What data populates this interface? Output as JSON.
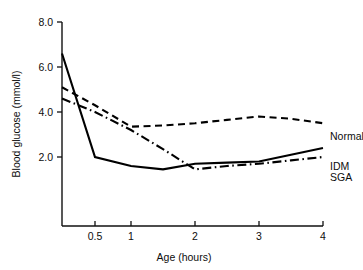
{
  "chart_data": {
    "type": "line",
    "title": "",
    "xlabel": "Age (hours)",
    "ylabel": "Blood glucose (mmol/l)",
    "xlim": [
      0.2,
      4
    ],
    "ylim": [
      1.0,
      8.0
    ],
    "x_ticks": [
      0.5,
      1,
      2,
      3,
      4
    ],
    "x_tick_labels": [
      "0.5",
      "1",
      "2",
      "3",
      "4"
    ],
    "y_ticks": [
      2.0,
      4.0,
      6.0,
      8.0
    ],
    "y_tick_labels": [
      "2.0",
      "4.0",
      "6.0",
      "8.0"
    ],
    "grid": false,
    "legend_position": "right-inline",
    "x_axis_scale": "non-linear compressed at low end",
    "series": [
      {
        "name": "Normal",
        "line_style": "dashed",
        "color": "#000000",
        "x": [
          0.2,
          0.5,
          1,
          1.5,
          2,
          2.5,
          3,
          3.5,
          4
        ],
        "values": [
          5.1,
          4.3,
          3.35,
          3.4,
          3.5,
          3.65,
          3.8,
          3.7,
          3.5
        ]
      },
      {
        "name": "IDM",
        "line_style": "solid",
        "color": "#000000",
        "x": [
          0.2,
          0.5,
          1,
          1.5,
          2,
          2.5,
          3,
          3.5,
          4
        ],
        "values": [
          6.6,
          2.0,
          1.6,
          1.45,
          1.7,
          1.75,
          1.8,
          2.1,
          2.4
        ]
      },
      {
        "name": "SGA",
        "line_style": "dash-dot",
        "color": "#000000",
        "x": [
          0.2,
          0.5,
          1,
          1.5,
          2,
          2.5,
          3,
          3.5,
          4
        ],
        "values": [
          4.6,
          4.0,
          3.2,
          2.35,
          1.45,
          1.6,
          1.7,
          1.85,
          2.0
        ]
      }
    ],
    "annotations": [
      {
        "text": "Normal",
        "at_x": 4,
        "at_y": 3.5
      },
      {
        "text": "IDM",
        "at_x": 4,
        "at_y": 2.45
      },
      {
        "text": "SGA",
        "at_x": 4,
        "at_y": 2.0
      }
    ]
  },
  "axes": {
    "y_title": "Blood glucose (mmol/l)",
    "x_title": "Age (hours)",
    "y_tick_labels": [
      "8.0",
      "6.0",
      "4.0",
      "2.0"
    ],
    "x_tick_labels": [
      "0.5",
      "1",
      "2",
      "3",
      "4"
    ]
  },
  "legend": {
    "normal": "Normal",
    "idm": "IDM",
    "sga": "SGA"
  }
}
